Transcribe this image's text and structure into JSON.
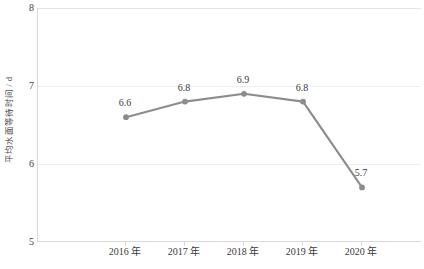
{
  "chart_data": {
    "type": "line",
    "title": "",
    "xlabel": "",
    "ylabel": "平均水面等待时间 / d",
    "categories": [
      "2016 年",
      "2017 年",
      "2018 年",
      "2019 年",
      "2020 年"
    ],
    "values": [
      6.6,
      6.8,
      6.9,
      6.8,
      5.7
    ],
    "point_labels": [
      "6.6",
      "6.8",
      "6.9",
      "6.8",
      "5.7"
    ],
    "ylim": [
      5,
      8
    ],
    "y_ticks": [
      "5",
      "6",
      "7",
      "8"
    ],
    "y_tick_values": [
      5,
      6,
      7,
      8
    ],
    "grid": "horizontal",
    "legend": "none",
    "series": [
      {
        "name": "平均水面等待时间",
        "values": [
          6.6,
          6.8,
          6.9,
          6.8,
          5.7
        ],
        "color": "#8c8c8c",
        "marker": "circle"
      }
    ]
  },
  "colors": {
    "line": "#8c8c8c",
    "marker": "#8c8c8c",
    "gridline": "#eceff1",
    "axis": "#d9d9d9",
    "text": "#3a3a3a",
    "background": "#ffffff"
  }
}
